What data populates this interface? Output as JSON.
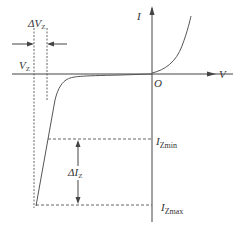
{
  "diagram": {
    "axes": {
      "x_label": "V",
      "y_label": "I",
      "origin_label": "O"
    },
    "labels": {
      "delta_vz": {
        "prefix": "Δ",
        "main": "V",
        "sub": "Z"
      },
      "vz": {
        "main": "V",
        "sub": "Z"
      },
      "delta_iz": {
        "prefix": "Δ",
        "main": "I",
        "sub": "Z"
      },
      "iz_min": {
        "main": "I",
        "sub": "Zmin"
      },
      "iz_max": {
        "main": "I",
        "sub": "Zmax"
      }
    },
    "colors": {
      "line": "#444444",
      "text": "#333333",
      "background": "#ffffff"
    }
  }
}
